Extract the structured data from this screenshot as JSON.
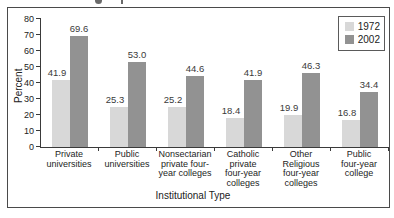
{
  "chart_data": {
    "type": "bar",
    "title": "",
    "xlabel": "Institutional Type",
    "ylabel": "Percent",
    "categories": [
      "Private universities",
      "Public universities",
      "Nonsectarian private four-year colleges",
      "Catholic private four-year colleges",
      "Other Religious four-year colleges",
      "Public four-year college"
    ],
    "category_label_lines": [
      [
        "Private",
        "universities"
      ],
      [
        "Public",
        "universities"
      ],
      [
        "Nonsectarian",
        "private four-",
        "year colleges"
      ],
      [
        "Catholic",
        "private",
        "four-year",
        "colleges"
      ],
      [
        "Other",
        "Religious",
        "four-year",
        "colleges"
      ],
      [
        "Public",
        "four-year",
        "college"
      ]
    ],
    "series": [
      {
        "name": "1972",
        "color": "#d8d8d8",
        "values": [
          41.9,
          25.3,
          25.2,
          18.4,
          19.9,
          16.8
        ]
      },
      {
        "name": "2002",
        "color": "#929292",
        "values": [
          69.6,
          53.0,
          44.6,
          41.9,
          46.3,
          34.4
        ]
      }
    ],
    "ylim": [
      0,
      80
    ],
    "yticks": [
      0,
      10,
      20,
      30,
      40,
      50,
      60,
      70,
      80
    ],
    "value_label_decimals": 1,
    "grid": false,
    "legend_position": "top-right"
  },
  "colors": {
    "frame_border": "#4a4a4a",
    "axis": "#3a3a3a",
    "bar_1972": "#d8d8d8",
    "bar_2002": "#929292",
    "text": "#222222"
  }
}
